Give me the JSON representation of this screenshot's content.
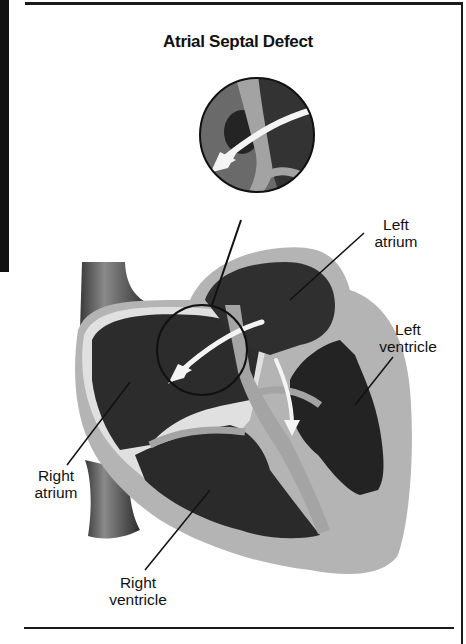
{
  "figure": {
    "title": "Atrial Septal Defect",
    "labels": {
      "left_atrium": [
        "Left",
        "atrium"
      ],
      "left_ventricle": [
        "Left",
        "ventricle"
      ],
      "right_atrium": [
        "Right",
        "atrium"
      ],
      "right_ventricle": [
        "Right",
        "ventricle"
      ]
    },
    "colors": {
      "chamber_dark": "#2a2a2a",
      "wall_gray": "#9a9a9a",
      "outer_gray": "#b4b4b4",
      "septum_light": "#a8a8a8",
      "arrow_white": "#f4f4f4",
      "frame_black": "#111111"
    }
  }
}
